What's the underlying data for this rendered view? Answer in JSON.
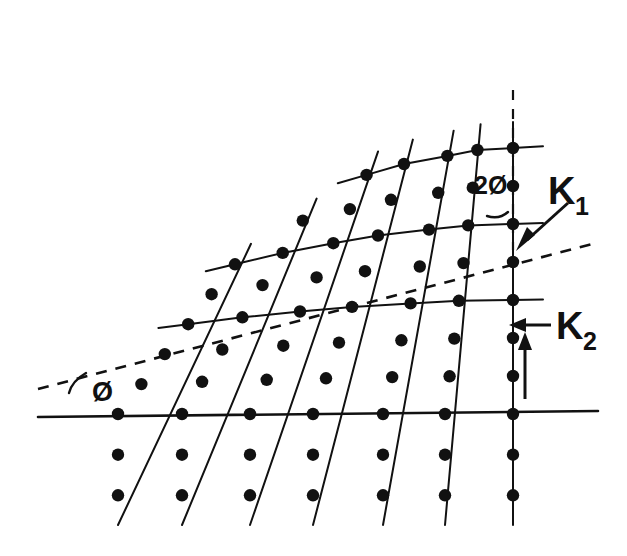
{
  "figure": {
    "background_color": "#ffffff",
    "ink_color": "#111111"
  },
  "labels": {
    "angle_phi": "Ø",
    "angle_two_phi": "2Ø",
    "k1_base": "K",
    "k1_subscript": "1",
    "k2_base": "K",
    "k2_subscript": "2"
  },
  "chart_data": {
    "type": "scatter",
    "xlabel": "",
    "ylabel": "",
    "xlim": [
      0,
      627
    ],
    "ylim": [
      0,
      556
    ],
    "grid": false,
    "legend": null,
    "geometry": {
      "pivot_point": [
        513,
        253
      ],
      "baseline_y": 414,
      "column_base_x": [
        118,
        182,
        250,
        313,
        383,
        445,
        513
      ],
      "column_rotation_deg": [
        38,
        32,
        26,
        20,
        14,
        7,
        0
      ],
      "lattice_spacing_px": 38,
      "nodes_below_baseline": 2,
      "baseline_extent_x": [
        38,
        598
      ],
      "below_line_end_y": 525
    },
    "annotations": [
      {
        "name": "angle-phi",
        "text": "Ø",
        "x": 92,
        "y": 399,
        "note": "angle between horizontal baseline and dashed reflecting plane"
      },
      {
        "name": "angle-two-phi",
        "text": "2Ø",
        "x": 478,
        "y": 190,
        "note": "angle between dashed vertical reference and the rotated end lattice column"
      },
      {
        "name": "k1-label",
        "text": "K1",
        "x": 552,
        "y": 196,
        "note": "incident wave vector, arrow points down-left to pivot"
      },
      {
        "name": "k2-label",
        "text": "K2",
        "x": 560,
        "y": 330,
        "note": "scattered wave vector, arrow points left toward lattice column"
      }
    ],
    "series": [
      {
        "name": "dashed-reflecting-plane",
        "kind": "dashed-line",
        "points": [
          [
            38,
            389
          ],
          [
            596,
            243
          ]
        ]
      },
      {
        "name": "dashed-vertical-reference",
        "kind": "dashed-line",
        "points": [
          [
            513,
            90
          ],
          [
            513,
            253
          ]
        ]
      },
      {
        "name": "horizontal-baseline",
        "kind": "solid-line",
        "points": [
          [
            38,
            417
          ],
          [
            598,
            411
          ]
        ]
      },
      {
        "name": "k1-arrow",
        "kind": "arrow",
        "points": [
          [
            566,
            205
          ],
          [
            519,
            248
          ]
        ]
      },
      {
        "name": "k2-arrow",
        "kind": "arrow",
        "points": [
          [
            548,
            325
          ],
          [
            510,
            325
          ]
        ]
      },
      {
        "name": "k2-up-arrow",
        "kind": "arrow",
        "points": [
          [
            524,
            398
          ],
          [
            524,
            334
          ]
        ]
      }
    ]
  }
}
